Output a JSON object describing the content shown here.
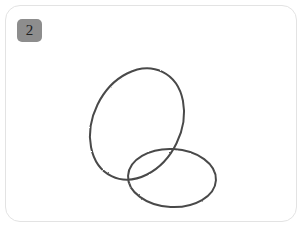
{
  "card": {
    "background_color": "#ffffff",
    "border_color": "#e3e3e3",
    "corner_radius_px": 15
  },
  "step_badge": {
    "label": "2",
    "background_color": "#8d8d8d",
    "text_color": "#20201f"
  },
  "drawing": {
    "title": "",
    "style": "hand-drawn pencil sketch outline",
    "stroke_color": "#4a4a4a",
    "stroke_width_px": 2,
    "fill": "none",
    "shapes": [
      {
        "name": "large-tilted-oval",
        "type": "ellipse",
        "center_x": 131,
        "center_y": 118,
        "radius_x": 44,
        "radius_y": 58,
        "rotation_deg": 26
      },
      {
        "name": "small-wide-oval",
        "type": "ellipse",
        "center_x": 166,
        "center_y": 172,
        "radius_x": 44,
        "radius_y": 29,
        "rotation_deg": 3
      }
    ]
  }
}
